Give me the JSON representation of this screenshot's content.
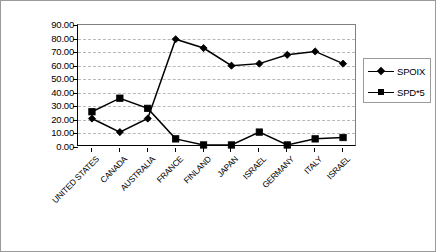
{
  "chart_data": {
    "type": "line",
    "title": "",
    "xlabel": "",
    "ylabel": "",
    "ylim": [
      0,
      90
    ],
    "y_ticks": [
      "0.00",
      "10.00",
      "20.00",
      "30.00",
      "40.00",
      "50.00",
      "60.00",
      "70.00",
      "80.00",
      "90.00"
    ],
    "y_tick_values": [
      0,
      10,
      20,
      30,
      40,
      50,
      60,
      70,
      80,
      90
    ],
    "grid": true,
    "legend_position": "right",
    "categories": [
      "UNITED STATES",
      "CANADA",
      "AUSTRALIA",
      "FRANCE",
      "FINLAND",
      "JAPAN",
      "ISRAEL",
      "GERMANY",
      "ITALY",
      "ISRAEL"
    ],
    "series": [
      {
        "name": "SPOIX",
        "marker": "diamond",
        "color": "#000000",
        "values": [
          21.0,
          11.0,
          21.0,
          79.5,
          73.0,
          60.0,
          61.5,
          68.0,
          70.5,
          61.5
        ]
      },
      {
        "name": "SPD*5",
        "marker": "square",
        "color": "#000000",
        "values": [
          26.0,
          36.0,
          28.5,
          6.0,
          1.5,
          1.5,
          11.0,
          1.5,
          6.0,
          7.0
        ]
      }
    ]
  },
  "legend": {
    "entries": [
      {
        "label": "SPOIX",
        "marker": "diamond"
      },
      {
        "label": "SPD*5",
        "marker": "square"
      }
    ]
  },
  "colors": {
    "series_line": "#000000",
    "grid": "#b9b9b9",
    "axis": "#000000",
    "frame_border": "#9a9a9a",
    "background": "#ffffff"
  }
}
